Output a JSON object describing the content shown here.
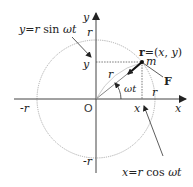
{
  "diagram": {
    "labels": {
      "y_eq": "y=r sin ωt",
      "x_eq": "x=r cos ωt",
      "r_vec": "r=(x, y)",
      "mass": "m",
      "force": "F",
      "angle": "ωt",
      "radius_top": "r",
      "radius_vec": "r",
      "radius_right": "r",
      "neg_r_left": "-r",
      "neg_r_bottom": "-r",
      "origin": "O",
      "x_proj": "x",
      "y_proj": "y",
      "x_axis": "x",
      "y_axis": "y"
    },
    "colors": {
      "line": "#333333",
      "circle": "#888888",
      "text": "#222222"
    },
    "geometry": {
      "origin": [
        96,
        99
      ],
      "radius": 59,
      "point_m": [
        142,
        62
      ]
    }
  }
}
